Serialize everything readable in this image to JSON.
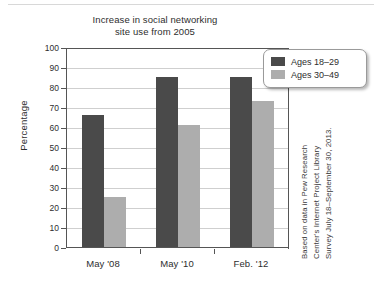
{
  "chart_data": {
    "type": "bar",
    "title": "Increase in social networking site use from 2005",
    "title_lines": [
      "Increase in social networking",
      "site use from 2005"
    ],
    "categories": [
      "May '08",
      "May '10",
      "Feb. '12"
    ],
    "series": [
      {
        "name": "Ages 18–29",
        "color": "#4a4a4a",
        "values": [
          66,
          85,
          85
        ]
      },
      {
        "name": "Ages 30–49",
        "color": "#adadad",
        "values": [
          25,
          61,
          73
        ]
      }
    ],
    "xlabel": "",
    "ylabel": "Percentage",
    "ylim": [
      0,
      100
    ],
    "ytick_step": 10,
    "yticks": [
      100,
      90,
      80,
      70,
      60,
      50,
      40,
      30,
      20,
      10,
      0
    ],
    "grid": true,
    "grid_axis": "y",
    "legend_position": "top-right",
    "annotations": [
      "Based on data in Pew Research",
      "Center's Internet Project Library",
      "Survey July 18–September 30, 2013."
    ]
  },
  "legend": {
    "entries": [
      {
        "label": "Ages 18–29"
      },
      {
        "label": "Ages 30–49"
      }
    ]
  },
  "source_note": {
    "lines": [
      "Based on data in Pew Research",
      "Center's Internet Project Library",
      "Survey July 18–September 30, 2013."
    ]
  },
  "colors": {
    "series_dark": "#4a4a4a",
    "series_light": "#adadad",
    "axis": "#555555",
    "gridline": "#cfcfcf",
    "text": "#2e2e2e",
    "background": "#ffffff"
  }
}
